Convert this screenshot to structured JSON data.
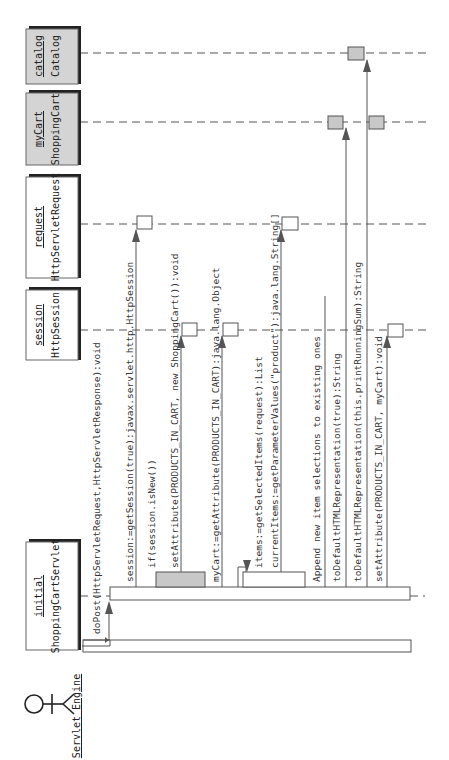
{
  "diagram": {
    "type": "uml-sequence-diagram",
    "orientation": "rotated-90-ccw",
    "actor": {
      "name": "Servlet Engine"
    },
    "objects": [
      {
        "instance": "initial",
        "class": "ShoppingCartServlet",
        "fill": "#ffffff"
      },
      {
        "instance": "session",
        "class": "HttpSession",
        "fill": "#ffffff"
      },
      {
        "instance": "request",
        "class": "HttpServletRequest",
        "fill": "#ffffff"
      },
      {
        "instance": "myCart",
        "class": "ShoppingCart",
        "fill": "#d4d4d4"
      },
      {
        "instance": "catalog",
        "class": "Catalog",
        "fill": "#d4d4d4"
      }
    ],
    "messages": [
      {
        "label": "doPost(HttpServletRequest,HttpServletResponse):void"
      },
      {
        "label": "session:=getSession(true):javax.servlet.http.HttpSession"
      },
      {
        "label": "if(session.isNew())"
      },
      {
        "label": "setAttribute(PRODUCTS_IN_CART, new ShoppingCart()):void"
      },
      {
        "label": "myCart:=getAttribute(PRODUCTS_IN_CART):java.lang.Object"
      },
      {
        "label": "items:=getSelectedItems(request):List"
      },
      {
        "label": "currentItems:=getParameterValues(\"product\"):java.lang.String[]"
      },
      {
        "label": "Append new item selections to existing ones"
      },
      {
        "label": "toDefaultHTMLRepresentation(true):String"
      },
      {
        "label": "toDefaultHTMLRepresentation(this.printRunningSum):String"
      },
      {
        "label": "setAttribute(PRODUCTS_IN_CART, myCart):void"
      }
    ],
    "colors": {
      "stroke": "#555555",
      "shaded_object": "#d4d4d4",
      "conditional_activation": "#a8a8a8"
    }
  }
}
